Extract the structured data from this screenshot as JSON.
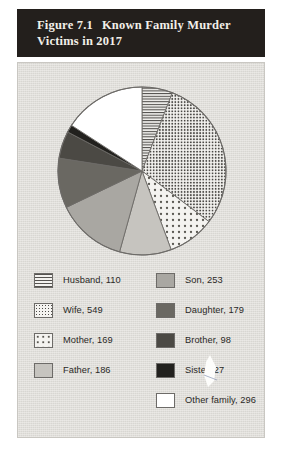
{
  "figure": {
    "number": "Figure 7.1",
    "title": "Known Family Murder Victims in 2017"
  },
  "chart_data": {
    "type": "pie",
    "title": "Known Family Murder Victims in 2017",
    "xlabel": "",
    "ylabel": "",
    "legend_position": "bottom",
    "grid": false,
    "total": 1867,
    "start_angle_deg": 0,
    "direction": "clockwise",
    "categories": [
      "Husband",
      "Wife",
      "Mother",
      "Father",
      "Son",
      "Daughter",
      "Brother",
      "Sister",
      "Other family"
    ],
    "values": [
      110,
      549,
      169,
      186,
      253,
      179,
      98,
      27,
      296
    ],
    "slices": [
      {
        "label": "Husband, 110",
        "name": "Husband",
        "value": 110,
        "pattern": "horizontal-lines",
        "color": "#f3f2ef"
      },
      {
        "label": "Wife, 549",
        "name": "Wife",
        "value": 549,
        "pattern": "dense-dots",
        "color": "#f4f3f0"
      },
      {
        "label": "Mother, 169",
        "name": "Mother",
        "value": 169,
        "pattern": "sparse-dots",
        "color": "#f4f3f0"
      },
      {
        "label": "Father, 186",
        "name": "Father",
        "value": 186,
        "pattern": "solid",
        "color": "#c6c4bf"
      },
      {
        "label": "Son, 253",
        "name": "Son",
        "value": 253,
        "pattern": "solid",
        "color": "#a9a7a2"
      },
      {
        "label": "Daughter, 179",
        "name": "Daughter",
        "value": 179,
        "pattern": "solid",
        "color": "#6a6862"
      },
      {
        "label": "Brother, 98",
        "name": "Brother",
        "value": 98,
        "pattern": "solid",
        "color": "#4b4944"
      },
      {
        "label": "Sister, 27",
        "name": "Sister",
        "value": 27,
        "pattern": "solid",
        "color": "#22211e"
      },
      {
        "label": "Other family, 296",
        "name": "Other family",
        "value": 296,
        "pattern": "solid",
        "color": "#ffffff"
      }
    ]
  },
  "legend": {
    "left_column": [
      {
        "label": "Husband, 110"
      },
      {
        "label": "Wife, 549"
      },
      {
        "label": "Mother, 169"
      },
      {
        "label": "Father, 186"
      }
    ],
    "right_column": [
      {
        "label": "Son, 253"
      },
      {
        "label": "Daughter, 179"
      },
      {
        "label": "Brother, 98"
      },
      {
        "label": "Sister, 27"
      },
      {
        "label": "Other family, 296"
      }
    ]
  },
  "colors": {
    "title_bar_bg": "#231f1c",
    "title_text": "#f2efe9",
    "panel_bg": "#dedcd7",
    "slice_outline": "#6d6b68"
  }
}
